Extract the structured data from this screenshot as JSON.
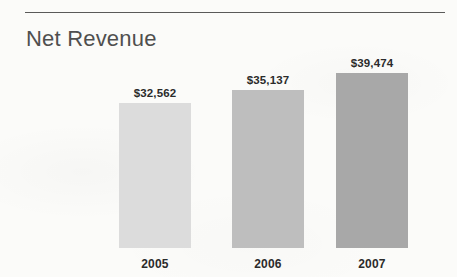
{
  "document": {
    "title": "Net Revenue"
  },
  "divider": {
    "name": "top-horizontal-rule"
  },
  "chart_data": {
    "type": "bar",
    "title": "Net Revenue",
    "xlabel": "",
    "ylabel": "",
    "categories": [
      "2005",
      "2006",
      "2007"
    ],
    "values": [
      32562,
      35137,
      39474
    ],
    "value_labels": [
      "$32,562",
      "$35,137",
      "$39,474"
    ],
    "series": [
      {
        "name": "Net Revenue",
        "values": [
          32562,
          35137,
          39474
        ]
      }
    ],
    "bar_colors": [
      "#dcdcdc",
      "#bebebe",
      "#a8a8a8"
    ],
    "grid": false,
    "legend": false,
    "axis_visible": false,
    "currency": "USD",
    "units": "thousands"
  },
  "colors": {
    "background": "#fbfbf9",
    "rule": "#3d3d3d",
    "title_text": "#4f4f4f",
    "label_text": "#2b2b2b",
    "bar_2005": "#dcdcdc",
    "bar_2006": "#bebebe",
    "bar_2007": "#a8a8a8"
  }
}
